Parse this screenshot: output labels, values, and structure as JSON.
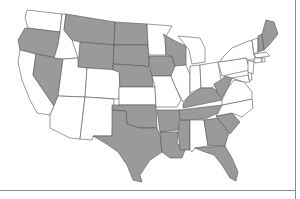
{
  "map": {
    "title": "United States map",
    "colors": {
      "shaded": "#9a9a9a",
      "unshaded": "#ffffff",
      "border": "#555555"
    },
    "shaded_states": [
      "OR",
      "NV",
      "MT",
      "WY",
      "ND",
      "SD",
      "NE",
      "WI",
      "IA",
      "TX",
      "OK",
      "AR",
      "LA",
      "MS",
      "TN",
      "KY",
      "WV",
      "GA",
      "SC",
      "FL",
      "ME",
      "NH"
    ],
    "unshaded_states": [
      "WA",
      "CA",
      "ID",
      "UT",
      "AZ",
      "CO",
      "NM",
      "KS",
      "MN",
      "MO",
      "IL",
      "MI",
      "IN",
      "OH",
      "AL",
      "NC",
      "VA",
      "PA",
      "NY",
      "VT",
      "MA",
      "CT",
      "RI",
      "NJ",
      "DE",
      "MD"
    ]
  }
}
